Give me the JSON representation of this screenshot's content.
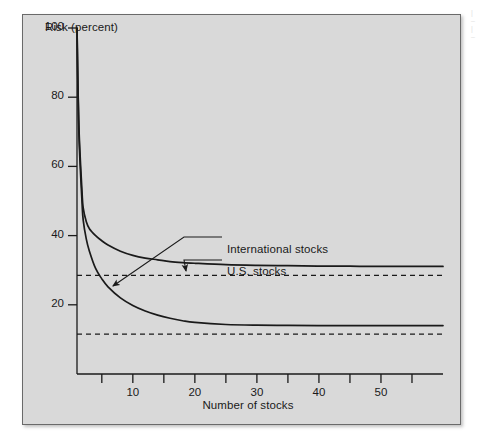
{
  "figure": {
    "background_color": "#ffffff",
    "panel_color": "#d9d9d9",
    "border_color": "#6a6a6a",
    "line_color": "#1a1a1a"
  },
  "chart_data": {
    "type": "line",
    "title": "",
    "xlabel": "Number of stocks",
    "ylabel": "Risk (percent)",
    "xlim": [
      1,
      60
    ],
    "ylim": [
      0,
      100
    ],
    "grid": false,
    "legend_position": "inline-annotations",
    "y_ticks": [
      20,
      40,
      60,
      80,
      100
    ],
    "y_tick_labels": [
      "20",
      "40",
      "60",
      "80",
      "100"
    ],
    "x_ticks": [
      5,
      10,
      15,
      20,
      25,
      30,
      35,
      40,
      45,
      50,
      55
    ],
    "x_tick_labels_shown": [
      "10",
      "20",
      "30",
      "40",
      "50"
    ],
    "x_labeled_ticks": [
      10,
      20,
      30,
      40,
      50
    ],
    "series": [
      {
        "name": "U.S. stocks",
        "style": "solid",
        "asymptote": 31,
        "x": [
          1,
          1.3,
          1.8,
          2,
          2.5,
          3,
          4,
          5,
          6,
          8,
          10,
          12,
          14,
          16,
          18,
          20,
          25,
          30,
          35,
          40,
          45,
          50,
          55,
          60
        ],
        "values": [
          100,
          72,
          53,
          48,
          44,
          42,
          40,
          38.5,
          37.3,
          35.5,
          34.3,
          33.5,
          33,
          32.5,
          32.2,
          32,
          31.6,
          31.4,
          31.3,
          31.2,
          31.15,
          31.1,
          31.1,
          31.1
        ]
      },
      {
        "name": "International stocks",
        "style": "solid",
        "asymptote": 14,
        "x": [
          1,
          1.3,
          1.8,
          2,
          2.5,
          3,
          4,
          5,
          6,
          8,
          10,
          12,
          14,
          16,
          18,
          20,
          25,
          30,
          35,
          40,
          45,
          50,
          55,
          60
        ],
        "values": [
          100,
          70,
          50,
          44.5,
          39,
          35.5,
          30.5,
          27.5,
          25.2,
          22,
          19.8,
          18.2,
          17,
          16.1,
          15.4,
          14.9,
          14.3,
          14.1,
          14.05,
          14,
          14,
          14,
          14,
          14
        ]
      }
    ],
    "reference_lines": [
      {
        "name": "us-systematic-risk",
        "style": "dashed",
        "y": 28.5
      },
      {
        "name": "international-systematic-risk",
        "style": "dashed",
        "y": 11.5
      }
    ],
    "annotations": [
      {
        "name": "international-stocks-label",
        "text": "International stocks",
        "points_to_series": "International stocks",
        "arrow_from": [
          222,
          237
        ],
        "arrow_to": [
          113,
          286
        ]
      },
      {
        "name": "us-stocks-label",
        "text": "U.S. stocks",
        "points_to_series": "U.S. stocks",
        "arrow_from": [
          222,
          260
        ],
        "arrow_to": [
          186,
          271
        ]
      }
    ]
  }
}
